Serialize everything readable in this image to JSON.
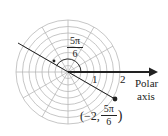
{
  "diagram": {
    "type": "polar-grid",
    "center": [
      68,
      72
    ],
    "ring_count": 8,
    "max_radius": 2,
    "spoke_angle_step_deg": 30,
    "grid_color": "#b8b8b8",
    "ink_color": "#222222"
  },
  "labels": {
    "tick_1": "1",
    "tick_2": "2",
    "polar_line1": "Polar",
    "polar_line2": "axis",
    "angle_num": "5π",
    "angle_den": "6",
    "point_prefix": "(−2,",
    "point_num": "5π",
    "point_den": "6",
    "point_suffix": ")"
  },
  "point": {
    "r": -2,
    "theta": "5π/6"
  }
}
